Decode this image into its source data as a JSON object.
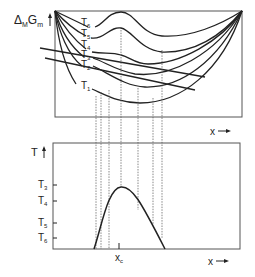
{
  "top_panel": {
    "ylabel_main": "Δ",
    "ylabel_sub1": "M",
    "ylabel_G": "G",
    "ylabel_sub2": "m",
    "xlabel": "x",
    "curve_labels": [
      {
        "base": "T",
        "sub": "6"
      },
      {
        "base": "T",
        "sub": "5"
      },
      {
        "base": "T",
        "sub": "4"
      },
      {
        "base": "T",
        "sub": "3"
      },
      {
        "base": "T",
        "sub": "2"
      },
      {
        "base": "T",
        "sub": "1"
      }
    ]
  },
  "bottom_panel": {
    "ylabel": "T",
    "xlabel": "x",
    "tick_labels": [
      {
        "base": "T",
        "sub": "3"
      },
      {
        "base": "T",
        "sub": "4"
      },
      {
        "base": "T",
        "sub": "5"
      },
      {
        "base": "T",
        "sub": "6"
      }
    ],
    "xc_label": {
      "base": "x",
      "sub": "c"
    }
  },
  "colors": {
    "line": "#222222",
    "frame": "#555555",
    "dotted": "#555555"
  }
}
